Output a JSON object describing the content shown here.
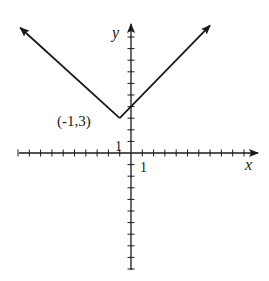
{
  "chart_data": {
    "type": "line",
    "title": "",
    "function": "y = |x + 1| + 3",
    "xlabel": "x",
    "ylabel": "y",
    "xlim": [
      -10,
      11
    ],
    "ylim": [
      -10,
      11
    ],
    "tick_spacing": 1,
    "grid": false,
    "series": [
      {
        "name": "absolute value graph",
        "x": [
          -9.8,
          -1,
          7.0
        ],
        "y": [
          10.8,
          3,
          11.0
        ],
        "arrows_at_ends": true
      }
    ],
    "annotations": [
      {
        "text": "(-1,3)",
        "x": -1,
        "y": 3,
        "note": "vertex"
      },
      {
        "text": "1",
        "axis": "x",
        "note": "unit tick label on x-axis"
      },
      {
        "text": "1",
        "axis": "y",
        "note": "unit tick label on y-axis"
      }
    ]
  },
  "labels": {
    "x_axis": "x",
    "y_axis": "y",
    "vertex": "(-1,3)",
    "x_unit": "1",
    "y_unit": "1"
  },
  "colors": {
    "ink": "#1a1a1a",
    "background": "#ffffff"
  }
}
